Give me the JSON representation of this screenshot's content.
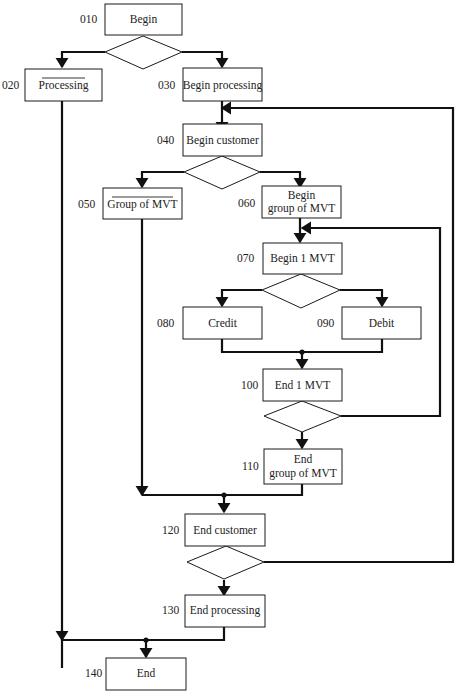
{
  "diagram": {
    "type": "structured program flowchart (Warnier-style nested loops)",
    "colors": {
      "line": "#111111",
      "box_fill": "#ffffff",
      "background": "#ffffff"
    },
    "nodes": [
      {
        "id": "010",
        "label": "Begin",
        "overbar": false
      },
      {
        "id": "020",
        "label": "Processing",
        "overbar": true
      },
      {
        "id": "030",
        "label": "Begin processing",
        "overbar": false
      },
      {
        "id": "040",
        "label": "Begin customer",
        "overbar": false
      },
      {
        "id": "050",
        "label": "Group of MVT",
        "overbar": true
      },
      {
        "id": "060",
        "label_line1": "Begin",
        "label_line2": "group of MVT",
        "overbar": false
      },
      {
        "id": "070",
        "label": "Begin 1 MVT",
        "overbar": false
      },
      {
        "id": "080",
        "label": "Credit",
        "overbar": false
      },
      {
        "id": "090",
        "label": "Debit",
        "overbar": false
      },
      {
        "id": "100",
        "label": "End 1 MVT",
        "overbar": false
      },
      {
        "id": "110",
        "label_line1": "End",
        "label_line2": "group of MVT",
        "overbar": false
      },
      {
        "id": "120",
        "label": "End customer",
        "overbar": false
      },
      {
        "id": "130",
        "label": "End processing",
        "overbar": false
      },
      {
        "id": "140",
        "label": "End",
        "overbar": false
      }
    ],
    "decisions": [
      {
        "after": "010",
        "branches": [
          "020",
          "030"
        ]
      },
      {
        "after": "040",
        "branches": [
          "050",
          "060"
        ]
      },
      {
        "after": "070",
        "branches": [
          "080",
          "090"
        ]
      },
      {
        "after": "100",
        "loop_back_to": "070",
        "exit": "110"
      },
      {
        "after": "120",
        "loop_back_to": "040",
        "exit": "130"
      }
    ],
    "merges": [
      {
        "from": [
          "080",
          "090"
        ],
        "to": "100"
      },
      {
        "from": [
          "050",
          "110"
        ],
        "to": "120"
      },
      {
        "from": [
          "020",
          "130"
        ],
        "to": "140"
      }
    ]
  }
}
